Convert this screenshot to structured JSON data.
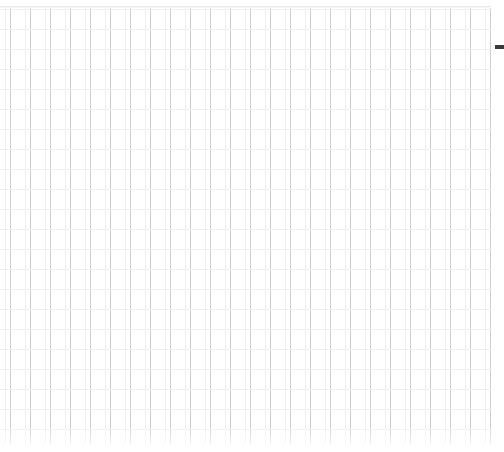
{
  "canvas": {
    "title": "Blank Grid Canvas",
    "width_px": 504,
    "height_px": 452,
    "background_color": "#ffffff"
  },
  "grid": {
    "label": "",
    "cell_size_px": 20,
    "major_line_color": "#c9ced6",
    "minor_line_color": "#eef0f3",
    "origin_x_px": 0,
    "origin_y_px": 8,
    "grid_width_px": 492,
    "grid_height_px": 436,
    "columns": 25,
    "rows": 22,
    "content": ""
  },
  "top_rule": {
    "label": "",
    "color": "#e9ebef",
    "y_px": 6
  },
  "edge_marker": {
    "label": "",
    "color": "#3a3a3a",
    "x_px": 495,
    "y_px": 45,
    "width_px": 9,
    "height_px": 4
  },
  "bottom_fade": {
    "label": "",
    "height_px": 26
  }
}
